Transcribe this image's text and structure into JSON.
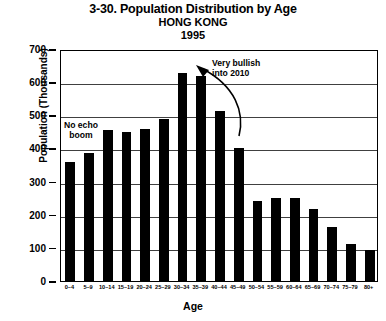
{
  "chart_data": {
    "type": "bar",
    "title": "3-30. Population Distribution by Age",
    "subtitle": "HONG KONG",
    "year": "1995",
    "xlabel": "Age",
    "ylabel": "Population (Thousands)",
    "categories": [
      "0–4",
      "5–9",
      "10–14",
      "15–19",
      "20–24",
      "25–29",
      "30–34",
      "35–39",
      "40–44",
      "45–49",
      "50–54",
      "55–59",
      "60–64",
      "65–69",
      "70–74",
      "75–79",
      "80+"
    ],
    "values": [
      358,
      385,
      455,
      450,
      460,
      490,
      628,
      620,
      512,
      400,
      240,
      250,
      250,
      218,
      162,
      112,
      95
    ],
    "ylim": [
      0,
      700
    ],
    "yticks": [
      0,
      100,
      200,
      300,
      400,
      500,
      600,
      700
    ],
    "grid": true,
    "legend": null,
    "bar_color": "#000000",
    "annotations": [
      {
        "text_line1": "No echo",
        "text_line2": "boom"
      },
      {
        "text_line1": "Very bullish",
        "text_line2": "into 2010"
      }
    ]
  }
}
